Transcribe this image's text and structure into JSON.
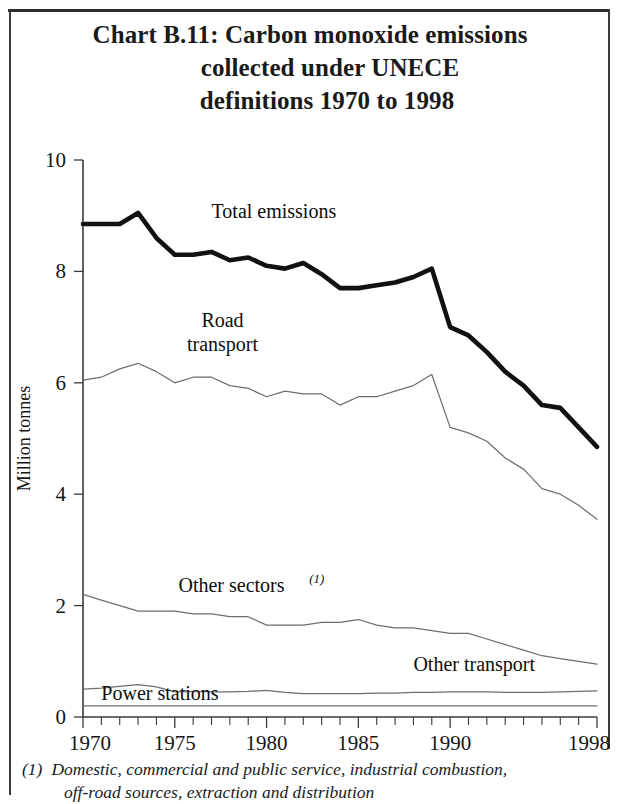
{
  "document": {
    "title_line1": "Chart B.11:  Carbon monoxide emissions",
    "title_line2": "collected under UNECE",
    "title_line3": "definitions 1970 to 1998"
  },
  "footnote": {
    "marker": "(1)",
    "line1": "Domestic, commercial and public service, industrial combustion,",
    "line2": "off-road sources, extraction and distribution"
  },
  "chart_data": {
    "type": "line",
    "title": "Chart B.11:  Carbon monoxide emissions collected under UNECE definitions 1970 to 1998",
    "xlabel": "",
    "ylabel": "Million tonnes",
    "xlim": [
      1970,
      1998
    ],
    "ylim": [
      0,
      10
    ],
    "yticks": [
      0,
      2,
      4,
      6,
      8,
      10
    ],
    "ytick_labels": [
      "0",
      "2",
      "4",
      "6",
      "8",
      "10"
    ],
    "xticks": [
      1970,
      1975,
      1980,
      1985,
      1990,
      1998
    ],
    "xtick_labels": [
      "1970",
      "1975",
      "1980",
      "1985",
      "1990",
      "1998"
    ],
    "x_minor_tick_interval": 1,
    "grid": false,
    "legend": "inline-labels",
    "x": [
      1970,
      1971,
      1972,
      1973,
      1974,
      1975,
      1976,
      1977,
      1978,
      1979,
      1980,
      1981,
      1982,
      1983,
      1984,
      1985,
      1986,
      1987,
      1988,
      1989,
      1990,
      1991,
      1992,
      1993,
      1994,
      1995,
      1996,
      1997,
      1998
    ],
    "series": [
      {
        "name": "Total emissions",
        "style": "thick",
        "label_x": 1977,
        "label_y": 8.95,
        "values": [
          8.85,
          8.85,
          8.85,
          9.05,
          8.6,
          8.3,
          8.3,
          8.35,
          8.2,
          8.25,
          8.1,
          8.05,
          8.15,
          7.95,
          7.7,
          7.7,
          7.75,
          7.8,
          7.9,
          8.05,
          7.0,
          6.85,
          6.55,
          6.2,
          5.95,
          5.6,
          5.55,
          5.2,
          4.85
        ]
      },
      {
        "name": "Road transport",
        "style": "thin",
        "label_line1": "Road",
        "label_line2": "transport",
        "label_x": 1977.6,
        "label_y": 7.0,
        "values": [
          6.05,
          6.1,
          6.25,
          6.35,
          6.2,
          6.0,
          6.1,
          6.1,
          5.95,
          5.9,
          5.75,
          5.85,
          5.8,
          5.8,
          5.6,
          5.75,
          5.75,
          5.85,
          5.95,
          6.15,
          5.2,
          5.1,
          4.95,
          4.65,
          4.45,
          4.1,
          4.0,
          3.8,
          3.55
        ]
      },
      {
        "name": "Other sectors",
        "style": "thin",
        "superscript": "(1)",
        "label_x": 1975.2,
        "label_y": 2.25,
        "values": [
          2.2,
          2.1,
          2.0,
          1.9,
          1.9,
          1.9,
          1.85,
          1.85,
          1.8,
          1.8,
          1.65,
          1.65,
          1.65,
          1.7,
          1.7,
          1.75,
          1.65,
          1.6,
          1.6,
          1.55,
          1.5,
          1.5,
          1.4,
          1.3,
          1.2,
          1.1,
          1.05,
          1.0,
          0.95
        ]
      },
      {
        "name": "Other transport",
        "style": "thin",
        "label_x": 1988.0,
        "label_y": 0.82,
        "values": [
          0.5,
          0.52,
          0.55,
          0.58,
          0.54,
          0.45,
          0.46,
          0.45,
          0.45,
          0.46,
          0.48,
          0.44,
          0.42,
          0.42,
          0.42,
          0.42,
          0.43,
          0.43,
          0.44,
          0.44,
          0.45,
          0.45,
          0.45,
          0.44,
          0.44,
          0.44,
          0.45,
          0.46,
          0.47
        ]
      },
      {
        "name": "Power stations",
        "style": "thin",
        "label_x": 1971.0,
        "label_y": 0.3,
        "values": [
          0.2,
          0.2,
          0.2,
          0.2,
          0.2,
          0.2,
          0.2,
          0.2,
          0.2,
          0.2,
          0.2,
          0.2,
          0.2,
          0.2,
          0.2,
          0.2,
          0.2,
          0.2,
          0.2,
          0.2,
          0.2,
          0.2,
          0.2,
          0.2,
          0.2,
          0.2,
          0.2,
          0.2,
          0.2
        ]
      }
    ]
  }
}
